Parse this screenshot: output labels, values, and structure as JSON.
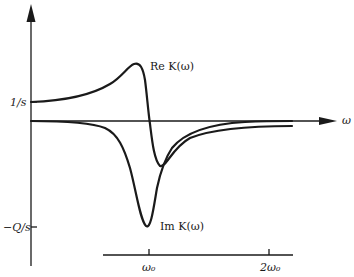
{
  "figure": {
    "x_axis_label": "ω",
    "y_ticks": [
      {
        "label": "1/s",
        "value": "1/s"
      },
      {
        "label": "−Q/s",
        "value": "-Q/s"
      }
    ],
    "freq_axis_ticks": [
      {
        "label": "ω₀"
      },
      {
        "label": "2ω₀"
      }
    ],
    "curve_labels": {
      "real": "Re K(ω)",
      "imag": "Im K(ω)"
    }
  },
  "colors": {
    "ink": "#1a1a1a",
    "background": "#ffffff"
  }
}
